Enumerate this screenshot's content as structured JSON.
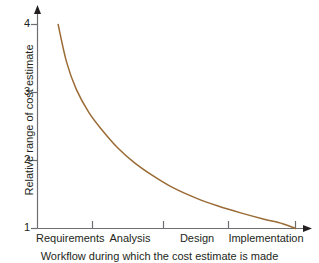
{
  "chart_data": {
    "type": "line",
    "title": "",
    "xlabel": "Workflow during which the cost estimate is made",
    "ylabel": "Relative range of cost estimate",
    "categories": [
      "Requirements",
      "Analysis",
      "Design",
      "Implementation"
    ],
    "yticks": [
      "1",
      "2",
      "3",
      "4"
    ],
    "ylim": [
      1,
      4.3
    ],
    "xlim": [
      0,
      4.35
    ],
    "grid": false,
    "legend": null,
    "series": [
      {
        "name": "Relative range of cost estimate",
        "color": "#9a6b35",
        "x": [
          0.32,
          0.45,
          0.6,
          0.8,
          1.0,
          1.25,
          1.5,
          1.8,
          2.1,
          2.45,
          2.8,
          3.15,
          3.5,
          3.8,
          4.0
        ],
        "values": [
          4.0,
          3.45,
          3.05,
          2.7,
          2.45,
          2.18,
          1.97,
          1.77,
          1.6,
          1.45,
          1.33,
          1.23,
          1.14,
          1.07,
          1.0
        ]
      }
    ],
    "annotations": []
  },
  "axes": {
    "y_arrow": true,
    "x_arrow": true,
    "axis_color": "#6d6e71"
  }
}
